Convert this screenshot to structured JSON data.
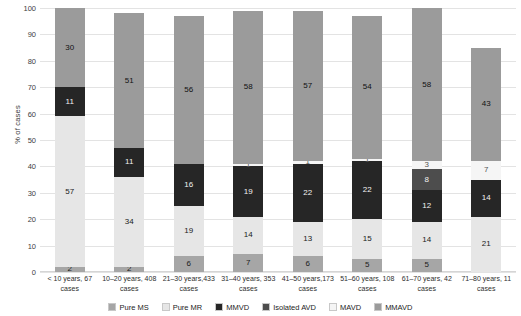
{
  "chart_data": {
    "type": "bar",
    "title": "",
    "subtype": "stacked-percentage",
    "xlabel": "",
    "ylabel": "% of cases",
    "ylim": [
      0,
      100
    ],
    "yticks": [
      0,
      10,
      20,
      30,
      40,
      50,
      60,
      70,
      80,
      90,
      100
    ],
    "grid": true,
    "legend_position": "bottom",
    "categories": [
      "< 10 years, 67 cases",
      "10–20 years, 408 cases",
      "21–30 years,433 cases",
      "31–40 years, 353 cases",
      "41–50 years,173 cases",
      "51–60 years, 108 cases",
      "61–70 years, 42 cases",
      "71–80 years, 11 cases"
    ],
    "series": [
      {
        "name": "Pure MS",
        "color": "#a6a6a6",
        "label_color": "#1a1a1a",
        "values": [
          2,
          2,
          6,
          7,
          6,
          5,
          5,
          0
        ]
      },
      {
        "name": "Pure MR",
        "color": "#e6e6e6",
        "label_color": "#1a1a1a",
        "values": [
          57,
          34,
          19,
          14,
          13,
          15,
          14,
          21
        ]
      },
      {
        "name": "MMVD",
        "color": "#262626",
        "label_color": "#f2f2f2",
        "values": [
          11,
          11,
          16,
          19,
          22,
          22,
          12,
          14
        ]
      },
      {
        "name": "Isolated AVD",
        "color": "#4d4d4d",
        "label_color": "#f2f2f2",
        "values": [
          0,
          0,
          0,
          0,
          0,
          0,
          8,
          0
        ]
      },
      {
        "name": "MAVD",
        "color": "#f5f5f5",
        "label_color": "#555555",
        "values": [
          0,
          0,
          0,
          1,
          1,
          1,
          3,
          7
        ]
      },
      {
        "name": "MMAVD",
        "color": "#9b9b9b",
        "label_color": "#111111",
        "values": [
          30,
          51,
          56,
          58,
          57,
          54,
          58,
          43
        ]
      }
    ]
  }
}
